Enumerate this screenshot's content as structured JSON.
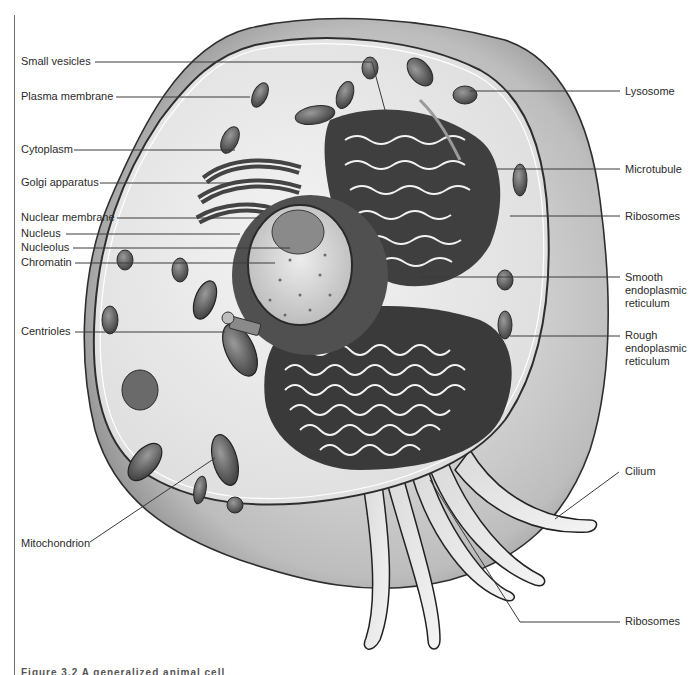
{
  "figure": {
    "caption_partial": "Figure 3.2  A generalized animal cell",
    "colors": {
      "background": "#ffffff",
      "line": "#3a3a3a",
      "label_text": "#2b2b2b",
      "cytoplasm": "#e9e9e9",
      "membrane_halo": "#cfcfcf",
      "organelle_dark": "#5a5a5a",
      "nucleus_fill": "#d8d8d8"
    }
  },
  "labels_left": [
    {
      "id": "small-vesicles",
      "text": "Small vesicles",
      "x": 21,
      "y": 55
    },
    {
      "id": "plasma-membrane",
      "text": "Plasma membrane",
      "x": 21,
      "y": 90
    },
    {
      "id": "cytoplasm",
      "text": "Cytoplasm",
      "x": 21,
      "y": 143
    },
    {
      "id": "golgi-apparatus",
      "text": "Golgi apparatus",
      "x": 21,
      "y": 176
    },
    {
      "id": "nuclear-membrane",
      "text": "Nuclear membrane",
      "x": 21,
      "y": 211
    },
    {
      "id": "nucleus",
      "text": "Nucleus",
      "x": 21,
      "y": 227
    },
    {
      "id": "nucleolus",
      "text": "Nucleolus",
      "x": 21,
      "y": 241
    },
    {
      "id": "chromatin",
      "text": "Chromatin",
      "x": 21,
      "y": 256
    },
    {
      "id": "centrioles",
      "text": "Centrioles",
      "x": 21,
      "y": 325
    },
    {
      "id": "mitochondrion",
      "text": "Mitochondrion",
      "x": 21,
      "y": 537
    }
  ],
  "labels_right": [
    {
      "id": "lysosome",
      "text": "Lysosome",
      "x": 625,
      "y": 85
    },
    {
      "id": "microtubule",
      "text": "Microtubule",
      "x": 625,
      "y": 163
    },
    {
      "id": "ribosomes-top",
      "text": "Ribosomes",
      "x": 625,
      "y": 210
    },
    {
      "id": "smooth-er",
      "text": "Smooth endoplasmic reticulum",
      "x": 625,
      "y": 271
    },
    {
      "id": "rough-er",
      "text": "Rough endoplasmic reticulum",
      "x": 625,
      "y": 329
    },
    {
      "id": "cilium",
      "text": "Cilium",
      "x": 625,
      "y": 465
    },
    {
      "id": "ribosomes-bottom",
      "text": "Ribosomes",
      "x": 625,
      "y": 615
    }
  ],
  "leader_lines": [
    {
      "label": "small-vesicles",
      "points": [
        [
          95,
          62
        ],
        [
          372,
          62
        ],
        [
          385,
          110
        ]
      ]
    },
    {
      "label": "plasma-membrane",
      "points": [
        [
          116,
          97
        ],
        [
          250,
          97
        ]
      ]
    },
    {
      "label": "cytoplasm",
      "points": [
        [
          74,
          150
        ],
        [
          235,
          150
        ]
      ]
    },
    {
      "label": "golgi-apparatus",
      "points": [
        [
          100,
          183
        ],
        [
          230,
          183
        ]
      ]
    },
    {
      "label": "nuclear-membrane",
      "points": [
        [
          117,
          218
        ],
        [
          260,
          218
        ]
      ]
    },
    {
      "label": "nucleus",
      "points": [
        [
          66,
          234
        ],
        [
          240,
          234
        ]
      ]
    },
    {
      "label": "nucleolus",
      "points": [
        [
          73,
          248
        ],
        [
          290,
          248
        ]
      ]
    },
    {
      "label": "chromatin",
      "points": [
        [
          75,
          263
        ],
        [
          275,
          263
        ]
      ]
    },
    {
      "label": "centrioles",
      "points": [
        [
          75,
          332
        ],
        [
          225,
          332
        ]
      ]
    },
    {
      "label": "mitochondrion",
      "points": [
        [
          90,
          542
        ],
        [
          215,
          458
        ]
      ]
    },
    {
      "label": "lysosome",
      "points": [
        [
          620,
          91
        ],
        [
          470,
          91
        ]
      ]
    },
    {
      "label": "microtubule",
      "points": [
        [
          620,
          169
        ],
        [
          495,
          169
        ]
      ]
    },
    {
      "label": "ribosomes-top",
      "points": [
        [
          620,
          216
        ],
        [
          510,
          216
        ]
      ]
    },
    {
      "label": "smooth-er",
      "points": [
        [
          620,
          277
        ],
        [
          420,
          277
        ]
      ]
    },
    {
      "label": "rough-er",
      "points": [
        [
          620,
          336
        ],
        [
          510,
          336
        ]
      ]
    },
    {
      "label": "cilium",
      "points": [
        [
          619,
          472
        ],
        [
          555,
          519
        ]
      ]
    },
    {
      "label": "ribosomes-bottom",
      "points": [
        [
          620,
          622
        ],
        [
          520,
          622
        ],
        [
          430,
          480
        ]
      ]
    }
  ]
}
